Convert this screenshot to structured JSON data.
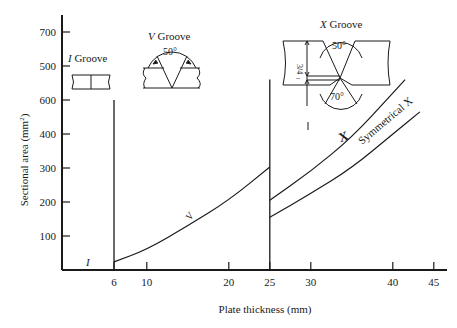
{
  "chart_data": {
    "type": "line",
    "title": "",
    "xlabel": "Plate thickness (mm)",
    "ylabel": "Sectional area (mm²)",
    "ylabel_base": "Sectional area (mm",
    "ylabel_sup": "2",
    "ylabel_end": ")",
    "xlim": [
      0,
      46
    ],
    "ylim": [
      0,
      750
    ],
    "grid": false,
    "legend_position": "inline labels",
    "x_ticks": [
      {
        "value": 6,
        "label": "6"
      },
      {
        "value": 10,
        "label": "10"
      },
      {
        "value": 20,
        "label": "20"
      },
      {
        "value": 25,
        "label": "25"
      },
      {
        "value": 30,
        "label": "30"
      },
      {
        "value": 40,
        "label": "40"
      },
      {
        "value": 45,
        "label": "45"
      }
    ],
    "y_ticks": [
      {
        "value": 100,
        "label": "100"
      },
      {
        "value": 200,
        "label": "200"
      },
      {
        "value": 300,
        "label": "300"
      },
      {
        "value": 400,
        "label": "400"
      },
      {
        "value": 500,
        "label": "600"
      },
      {
        "value": 600,
        "label": "500"
      },
      {
        "value": 700,
        "label": "700"
      }
    ],
    "series": [
      {
        "name": "I",
        "label": "I",
        "x": [
          0,
          6
        ],
        "values": [
          0,
          0
        ],
        "boundary_line_x": 6,
        "boundary_top": 500
      },
      {
        "name": "V",
        "label": "V",
        "x": [
          6,
          10,
          15,
          20,
          25
        ],
        "values": [
          24,
          60,
          130,
          205,
          303
        ]
      },
      {
        "name": "X",
        "label": "X",
        "x": [
          25,
          30,
          35,
          40,
          41.5
        ],
        "values": [
          205,
          290,
          390,
          520,
          560
        ]
      },
      {
        "name": "Symmetrical X",
        "label": "Symmetrical X",
        "x": [
          25,
          30,
          35,
          40,
          43.3
        ],
        "values": [
          155,
          225,
          300,
          400,
          465
        ]
      }
    ],
    "boundaries": [
      {
        "x": 6,
        "top": 500
      },
      {
        "x": 25,
        "top": 560
      }
    ],
    "annotations": [
      {
        "text": "I Groove",
        "italic_prefix": "I",
        "rest": " Groove"
      },
      {
        "text": "V Groove",
        "italic_prefix": "V",
        "rest": " Groove",
        "angle": "50°"
      },
      {
        "text": "X Groove",
        "italic_prefix": "X",
        "rest": " Groove",
        "angle_top": "50°",
        "angle_bottom": "70°",
        "dim_top": "3/4",
        "dim_bottom": "1/4"
      }
    ]
  }
}
